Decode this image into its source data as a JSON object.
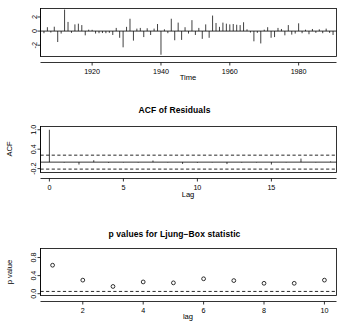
{
  "figure": {
    "kind": "r-tsdiag-diagnostic-plots",
    "panels": [
      "residuals",
      "acf-of-residuals",
      "p-values-ljung-box"
    ]
  },
  "chart_data": [
    {
      "type": "line",
      "name": "standardized-residuals",
      "title": "",
      "xlabel": "Time",
      "ylabel": "",
      "xlim": [
        1905,
        1991
      ],
      "ylim": [
        -3.6,
        3.2
      ],
      "xticks": [
        1920,
        1940,
        1960,
        1980
      ],
      "xtick_labels": [
        "1920",
        "1940",
        "1960",
        "1980"
      ],
      "yticks": [
        -2,
        0,
        2
      ],
      "ytick_labels": [
        "-2",
        "0",
        "2"
      ],
      "grid": false,
      "legend": "none",
      "x": [
        1906,
        1907,
        1908,
        1909,
        1910,
        1911,
        1912,
        1913,
        1914,
        1915,
        1916,
        1917,
        1918,
        1919,
        1920,
        1921,
        1922,
        1923,
        1924,
        1925,
        1926,
        1927,
        1928,
        1929,
        1930,
        1931,
        1932,
        1933,
        1934,
        1935,
        1936,
        1937,
        1938,
        1939,
        1940,
        1941,
        1942,
        1943,
        1944,
        1945,
        1946,
        1947,
        1948,
        1949,
        1950,
        1951,
        1952,
        1953,
        1954,
        1955,
        1956,
        1957,
        1958,
        1959,
        1960,
        1961,
        1962,
        1963,
        1964,
        1965,
        1966,
        1967,
        1968,
        1969,
        1970,
        1971,
        1972,
        1973,
        1974,
        1975,
        1976,
        1977,
        1978,
        1979,
        1980,
        1981,
        1982,
        1983,
        1984,
        1985,
        1986,
        1987,
        1988,
        1989,
        1990
      ],
      "values": [
        -0.3,
        0.55,
        -0.2,
        0.62,
        -1.55,
        -0.35,
        3.05,
        1.3,
        -0.25,
        0.95,
        1.05,
        0.85,
        -0.6,
        0.2,
        0.18,
        -0.35,
        -0.3,
        -0.28,
        -0.3,
        -0.25,
        -0.55,
        0.45,
        -0.95,
        -2.3,
        0.6,
        1.75,
        -1.35,
        0.35,
        0.45,
        -0.85,
        0.4,
        -0.55,
        0.35,
        1.0,
        -3.35,
        0.25,
        -0.3,
        1.75,
        -1.3,
        1.2,
        -1.25,
        0.55,
        -0.35,
        1.55,
        -0.55,
        0.45,
        -1.1,
        0.95,
        -0.95,
        2.2,
        1.15,
        0.6,
        1.2,
        1.05,
        0.95,
        1.0,
        0.9,
        0.85,
        1.25,
        0.25,
        -0.2,
        -1.45,
        -0.25,
        -1.75,
        0.2,
        0.55,
        -0.95,
        -0.85,
        0.45,
        0.3,
        -0.6,
        0.85,
        -0.5,
        -0.35,
        1.1,
        -0.3,
        0.2,
        -0.45,
        0.3,
        -0.25,
        0.25,
        -0.3,
        0.35,
        -0.25,
        -0.55
      ]
    },
    {
      "type": "bar",
      "name": "acf-of-residuals",
      "title": "ACF of Residuals",
      "xlabel": "Lag",
      "ylabel": "ACF",
      "xlim": [
        -0.6,
        19.4
      ],
      "ylim": [
        -0.32,
        1.1
      ],
      "xticks": [
        0,
        5,
        10,
        15
      ],
      "xtick_labels": [
        "0",
        "5",
        "10",
        "15"
      ],
      "yticks": [
        -0.2,
        0.4,
        1.0
      ],
      "ytick_labels": [
        "-0.2",
        "0.4",
        "1.0"
      ],
      "grid": false,
      "legend": "none",
      "confidence_bounds": [
        0.215,
        -0.215
      ],
      "lags": [
        0,
        1,
        2,
        3,
        4,
        5,
        6,
        7,
        8,
        9,
        10,
        11,
        12,
        13,
        14,
        15,
        16,
        17,
        18,
        19
      ],
      "values": [
        1.0,
        -0.015,
        -0.075,
        0.06,
        -0.02,
        -0.01,
        -0.012,
        0.05,
        -0.01,
        -0.055,
        -0.02,
        -0.01,
        -0.06,
        -0.015,
        -0.012,
        -0.075,
        -0.01,
        0.11,
        -0.01,
        0.02
      ]
    },
    {
      "type": "scatter",
      "name": "p-values-ljung-box",
      "title": "p values for Ljung−Box statistic",
      "xlabel": "lag",
      "ylabel": "p value",
      "xlim": [
        0.6,
        10.4
      ],
      "ylim": [
        -0.04,
        1.0
      ],
      "xticks": [
        2,
        4,
        6,
        8,
        10
      ],
      "xtick_labels": [
        "2",
        "4",
        "6",
        "8",
        "10"
      ],
      "yticks": [
        0.0,
        0.4,
        0.8
      ],
      "ytick_labels": [
        "0.0",
        "0.4",
        "0.8"
      ],
      "grid": false,
      "legend": "none",
      "significance_level": 0.05,
      "x": [
        1,
        2,
        3,
        4,
        5,
        6,
        7,
        8,
        9,
        10
      ],
      "values": [
        0.63,
        0.3,
        0.16,
        0.26,
        0.24,
        0.33,
        0.29,
        0.23,
        0.23,
        0.3
      ]
    }
  ]
}
